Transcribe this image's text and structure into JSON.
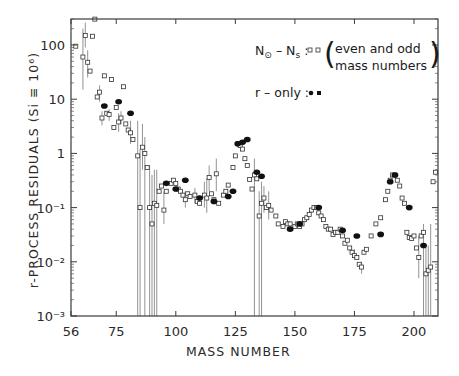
{
  "chart_data": {
    "type": "scatter",
    "title": "",
    "xlabel": "MASS NUMBER",
    "ylabel": "r-PROCESS RESIDUALS (Si ≡ 10⁶)",
    "xlim": [
      56,
      209
    ],
    "ylim": [
      0.001,
      300
    ],
    "yscale": "log",
    "grid": false,
    "x_ticks": [
      56,
      75,
      100,
      125,
      150,
      175,
      200
    ],
    "x_tick_labels": [
      "56",
      "75",
      "100",
      "125",
      "150",
      "175",
      "200"
    ],
    "y_ticks": [
      100,
      10,
      1,
      0.1,
      0.01,
      0.001
    ],
    "y_tick_labels": [
      "100",
      "10",
      "1",
      "10⁻¹",
      "10⁻²",
      "10⁻³"
    ],
    "legend": {
      "position": "upper right",
      "entries": [
        {
          "label": "N⊙ – Ns :",
          "markers": "open squares",
          "note_line1": "even and odd",
          "note_line2": "mass numbers"
        },
        {
          "label": "r – only :",
          "markers": "filled circles"
        }
      ]
    },
    "series": [
      {
        "name": "N⊙ - Ns (even and odd mass numbers)",
        "marker": "open-square",
        "points": [
          [
            58,
            95
          ],
          [
            61,
            60,
            15,
            200
          ],
          [
            62,
            150,
            90,
            260
          ],
          [
            63,
            48,
            25,
            80
          ],
          [
            64,
            33
          ],
          [
            65,
            145
          ],
          [
            66,
            300
          ],
          [
            67,
            11
          ],
          [
            68,
            13.5,
            9,
            18
          ],
          [
            69,
            4.5,
            3.3,
            6
          ],
          [
            70,
            27
          ],
          [
            71,
            5.5
          ],
          [
            72,
            5.2,
            4,
            6.5
          ],
          [
            73,
            23
          ],
          [
            74,
            3
          ],
          [
            75,
            7
          ],
          [
            76,
            3.8,
            2.5,
            5.5
          ],
          [
            77,
            4.5,
            3.5,
            6
          ],
          [
            78,
            17
          ],
          [
            79,
            3.5
          ],
          [
            80,
            2.7
          ],
          [
            81,
            2.4,
            1.5,
            4
          ],
          [
            82,
            1.8
          ],
          [
            84,
            0.9,
            0.001,
            4
          ],
          [
            85,
            0.1,
            0.001,
            1.2
          ],
          [
            86,
            1.3,
            0.5,
            3.5
          ],
          [
            87,
            1.0,
            0.001,
            2
          ],
          [
            88,
            0.55
          ],
          [
            89,
            0.1,
            0.001,
            0.6
          ],
          [
            90,
            0.05,
            0.001,
            0.4
          ],
          [
            91,
            0.12,
            0.001,
            0.5
          ],
          [
            92,
            0.11,
            0.001,
            0.5
          ],
          [
            93,
            0.2
          ],
          [
            94,
            0.25
          ],
          [
            95,
            0.09,
            0.05,
            0.2
          ],
          [
            96,
            0.2
          ],
          [
            98,
            0.28
          ],
          [
            99,
            0.32
          ],
          [
            100,
            0.28
          ],
          [
            101,
            0.22
          ],
          [
            102,
            0.2
          ],
          [
            103,
            0.17
          ],
          [
            104,
            0.14,
            0.1,
            0.2
          ],
          [
            105,
            0.18
          ],
          [
            106,
            0.16
          ],
          [
            108,
            0.17,
            0.12,
            0.23
          ],
          [
            109,
            0.13
          ],
          [
            110,
            0.12
          ],
          [
            112,
            0.17,
            0.1,
            0.3
          ],
          [
            113,
            0.15,
            0.08,
            0.35
          ],
          [
            114,
            0.36,
            0.2,
            0.6
          ],
          [
            115,
            0.18
          ],
          [
            116,
            0.14
          ],
          [
            117,
            0.42,
            0.2,
            0.8
          ],
          [
            118,
            0.12
          ],
          [
            120,
            0.17
          ],
          [
            121,
            0.2
          ],
          [
            122,
            0.26
          ],
          [
            124,
            0.55
          ],
          [
            125,
            0.9
          ],
          [
            126,
            1.5
          ],
          [
            127,
            1.4
          ],
          [
            128,
            1.2
          ],
          [
            129,
            0.8
          ],
          [
            130,
            0.6
          ],
          [
            131,
            0.33
          ],
          [
            132,
            0.22
          ],
          [
            133,
            0.4,
            0.001,
            0.8
          ],
          [
            134,
            0.34
          ],
          [
            135,
            0.07,
            0.001,
            0.2
          ],
          [
            136,
            0.12,
            0.001,
            0.3
          ],
          [
            137,
            0.15,
            0.08,
            0.25
          ],
          [
            138,
            0.1
          ],
          [
            139,
            0.11,
            0.06,
            0.2
          ],
          [
            140,
            0.09
          ],
          [
            142,
            0.07
          ],
          [
            143,
            0.05
          ],
          [
            145,
            0.045
          ],
          [
            146,
            0.055
          ],
          [
            147,
            0.05
          ],
          [
            148,
            0.05
          ],
          [
            150,
            0.045
          ],
          [
            151,
            0.05
          ],
          [
            152,
            0.045
          ],
          [
            153,
            0.05
          ],
          [
            154,
            0.06
          ],
          [
            155,
            0.065
          ],
          [
            156,
            0.075
          ],
          [
            157,
            0.09
          ],
          [
            158,
            0.1
          ],
          [
            159,
            0.1
          ],
          [
            160,
            0.08
          ],
          [
            161,
            0.07
          ],
          [
            162,
            0.06
          ],
          [
            163,
            0.045
          ],
          [
            164,
            0.04
          ],
          [
            165,
            0.04
          ],
          [
            166,
            0.032
          ],
          [
            167,
            0.035
          ],
          [
            168,
            0.035
          ],
          [
            169,
            0.04
          ],
          [
            170,
            0.03
          ],
          [
            171,
            0.022
          ],
          [
            172,
            0.025
          ],
          [
            173,
            0.018
          ],
          [
            174,
            0.015
          ],
          [
            175,
            0.013,
            0.011,
            0.017
          ],
          [
            176,
            0.012
          ],
          [
            177,
            0.009
          ],
          [
            178,
            0.008,
            0.006,
            0.01
          ],
          [
            179,
            0.015
          ],
          [
            180,
            0.017
          ],
          [
            182,
            0.03
          ],
          [
            184,
            0.05
          ],
          [
            186,
            0.065
          ],
          [
            188,
            0.14
          ],
          [
            189,
            0.2
          ],
          [
            190,
            0.32
          ],
          [
            191,
            0.4
          ],
          [
            192,
            0.4
          ],
          [
            193,
            0.32
          ],
          [
            194,
            0.25
          ],
          [
            195,
            0.15
          ],
          [
            196,
            0.12
          ],
          [
            197,
            0.035
          ],
          [
            198,
            0.028
          ],
          [
            199,
            0.027
          ],
          [
            200,
            0.03
          ],
          [
            201,
            0.018
          ],
          [
            202,
            0.012,
            0.005,
            0.03
          ],
          [
            203,
            0.03
          ],
          [
            204,
            0.035,
            0.001,
            0.05
          ],
          [
            205,
            0.006,
            0.001,
            0.02
          ],
          [
            206,
            0.007,
            0.001,
            0.02
          ],
          [
            207,
            0.008,
            0.001,
            0.05
          ],
          [
            208,
            0.3
          ],
          [
            209,
            0.45
          ]
        ]
      },
      {
        "name": "r-only",
        "marker": "filled-circle",
        "points": [
          [
            70,
            7.5
          ],
          [
            76,
            9
          ],
          [
            81,
            5.5
          ],
          [
            96,
            0.28
          ],
          [
            100,
            0.22
          ],
          [
            104,
            0.32
          ],
          [
            110,
            0.15
          ],
          [
            116,
            0.13
          ],
          [
            122,
            0.16
          ],
          [
            124,
            0.2
          ],
          [
            126,
            1.5
          ],
          [
            128,
            1.6
          ],
          [
            130,
            1.8
          ],
          [
            134,
            0.45
          ],
          [
            136,
            0.38
          ],
          [
            148,
            0.04
          ],
          [
            152,
            0.05
          ],
          [
            160,
            0.1
          ],
          [
            170,
            0.038
          ],
          [
            176,
            0.03
          ],
          [
            186,
            0.032
          ],
          [
            190,
            0.3
          ],
          [
            192,
            0.4
          ],
          [
            198,
            0.1
          ],
          [
            204,
            0.02
          ]
        ]
      }
    ]
  },
  "figure": {
    "axis_color": "#3a3a3a",
    "marker_color": "#222222",
    "errorbar_color": "#777777",
    "background": "#ffffff"
  }
}
